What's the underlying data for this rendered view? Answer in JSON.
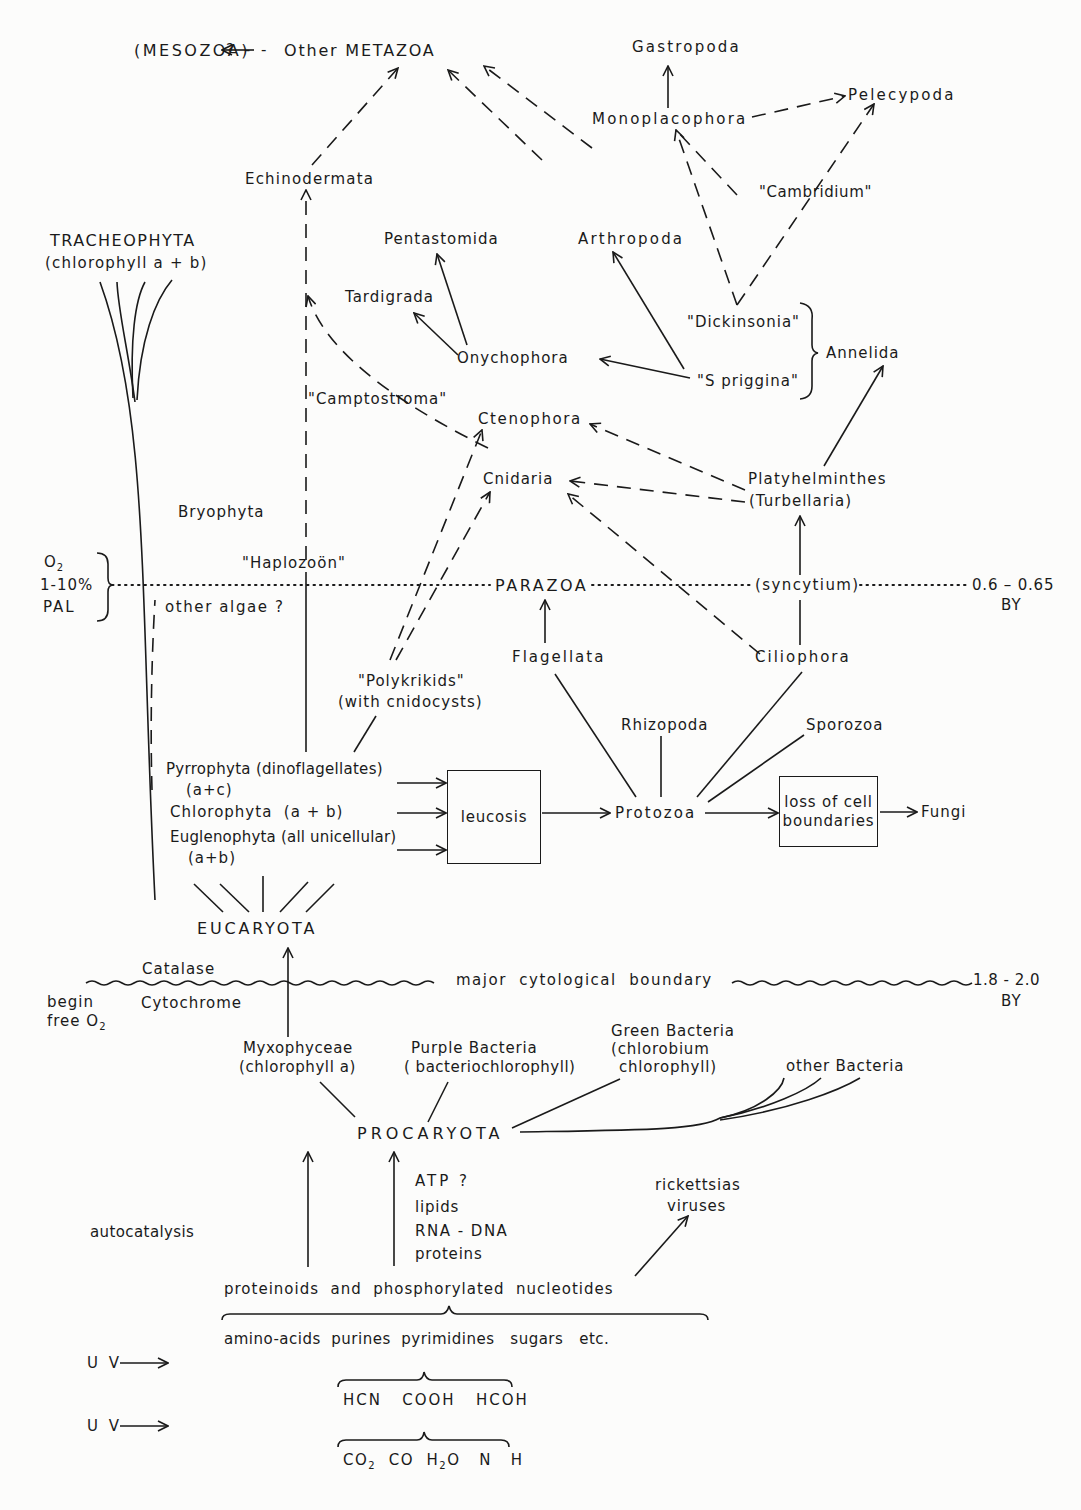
{
  "diagram": {
    "nodes": {
      "mesozoa": "(MESOZOA)",
      "mesozoa_link": "? - -",
      "other_metazoa": "Other METAZOA",
      "gastropoda": "Gastropoda",
      "pelecypoda": "Pelecypoda",
      "monoplacophora": "Monoplacophora",
      "echinodermata": "Echinodermata",
      "cambridium": "\"Cambridium\"",
      "tracheophyta": "TRACHEOPHYTA",
      "tracheophyta_sub": "(chlorophyll a + b)",
      "pentastomida": "Pentastomida",
      "arthropoda": "Arthropoda",
      "tardigrada": "Tardigrada",
      "dickinsonia": "\"Dickinsonia\"",
      "annelida": "Annelida",
      "onychophora": "Onychophora",
      "spriggina": "\"S priggina\"",
      "camptostroma": "\"Camptostroma\"",
      "ctenophora": "Ctenophora",
      "cnidaria": "Cnidaria",
      "platyhelminthes": "Platyhelminthes",
      "turbellaria": "(Turbellaria)",
      "bryophyta": "Bryophyta",
      "haplozoon": "\"Haplozoön\"",
      "parazoa": "PARAZOA",
      "syncytium": "(syncytium)",
      "other_algae": "other algae ?",
      "flagellata": "Flagellata",
      "ciliophora": "Ciliophora",
      "polykrikids": "\"Polykrikids\"",
      "polykrikids_sub": "(with cnidocysts)",
      "rhizopoda": "Rhizopoda",
      "sporozoa": "Sporozoa",
      "pyrrophyta": "Pyrrophyta (dinoflagellates)",
      "pyrrophyta_sub": "(a+c)",
      "chlorophyta": "Chlorophyta  (a + b)",
      "euglenophyta": "Euglenophyta (all unicellular)",
      "euglenophyta_sub": "(a+b)",
      "leucosis": "leucosis",
      "protozoa": "Protozoa",
      "loss_of_cell_boundaries": "loss of cell boundaries",
      "fungi": "Fungi",
      "eucaryota": "EUCARYOTA",
      "catalase": "Catalase",
      "cytochrome": "Cytochrome",
      "begin_free_o2_line1": "begin",
      "begin_free_o2_line2": "free O",
      "major_boundary": "major  cytological  boundary",
      "myxophyceae": "Myxophyceae",
      "myxophyceae_sub": "(chlorophyll a)",
      "purple_bacteria": "Purple Bacteria",
      "purple_bacteria_sub": "( bacteriochlorophyll)",
      "green_bacteria": "Green Bacteria",
      "green_bacteria_sub1": "(chlorobium",
      "green_bacteria_sub2": "chlorophyll)",
      "other_bacteria": "other Bacteria",
      "procaryota": "PROCARYOTA",
      "atp": "ATP ?",
      "lipids": "lipids",
      "rna_dna": "RNA - DNA",
      "proteins": "proteins",
      "rickettsias": "rickettsias",
      "viruses": "viruses",
      "autocatalysis": "autocatalysis",
      "proteinoids": "proteinoids  and  phosphorylated  nucleotides",
      "monomers": "amino-acids  purines  pyrimidines   sugars   etc.",
      "uv1": "U V",
      "uv2": "U V",
      "small_molecules": "HCN   COOH   HCOH",
      "primordial": [
        "CO",
        "CO  H",
        "O   N   H"
      ]
    },
    "timescale": {
      "o2_label": "O",
      "o2_level": "1-10%",
      "o2_unit": "PAL",
      "parazoa_age": "0.6 – 0.65",
      "parazoa_age_unit": "BY",
      "boundary_age": "1.8 - 2.0",
      "boundary_age_unit": "BY"
    }
  }
}
